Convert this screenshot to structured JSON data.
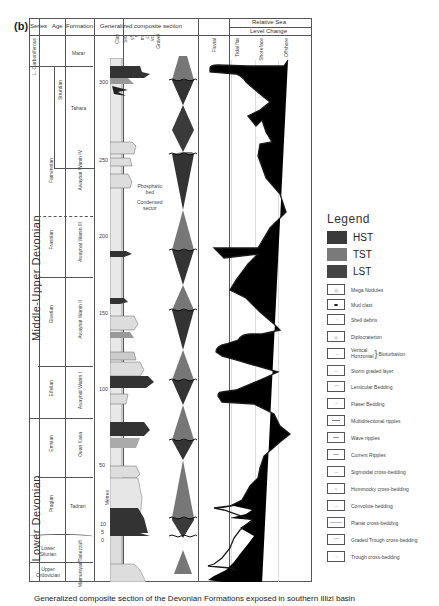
{
  "figure": {
    "panel_label": "(b)",
    "caption": "Generalized composite section of the Devonian Formations exposed in southern Illizi basin"
  },
  "columns": {
    "series": "Series",
    "age": "Age",
    "formation": "Formation",
    "section": "Generalized composite section",
    "sea_level_line1": "Relative Sea",
    "sea_level_line2": "Level Change"
  },
  "grain_size": [
    "Clay",
    "Silt",
    "vf",
    "f",
    "m",
    "c",
    "vc",
    "Gravel"
  ],
  "environments": [
    "Fluvial",
    "Tidal flat",
    "Shoreface",
    "Offshore"
  ],
  "series_units": [
    {
      "label": "L. Carboniferous"
    },
    {
      "label": "Middle-Upper Devonian"
    },
    {
      "label": "Lower Devonian"
    },
    {
      "label": "Lower Silurian"
    },
    {
      "label": "Upper Ordovician"
    }
  ],
  "age_units": [
    "Struntian",
    "Famennian",
    "Frasnian",
    "Givetian",
    "Eifelian",
    "Emsian",
    "Pragian"
  ],
  "formation_units": [
    "Marar",
    "Tahara",
    "Awaynat Wanin IV",
    "Awaynat Wanin III",
    "Awaynat Wanin II",
    "Awaynat Wanin I",
    "Ouan Kasa",
    "Tadrart",
    "Mamuniyat/Tanezzuft"
  ],
  "depth_axis": {
    "unit": "Metres",
    "ticks": [
      "300",
      "250",
      "200",
      "150",
      "100",
      "50",
      "10",
      "5",
      "0"
    ]
  },
  "annotation": {
    "phosphatic_line1": "Phosphatic",
    "phosphatic_line2": "bed",
    "phosphatic_line3": "Condensed",
    "phosphatic_line4": "sector"
  },
  "legend": {
    "title": "Legend",
    "systems_tracts": [
      {
        "label": "HST",
        "color": "#3a3a3a"
      },
      {
        "label": "TST",
        "color": "#7a7a7a"
      },
      {
        "label": "LST",
        "color": "#444444"
      }
    ],
    "symbols": [
      {
        "label": "Mega Nodules",
        "icon": "nodule-icon"
      },
      {
        "label": "Mud clast",
        "icon": "mud-clast-icon"
      },
      {
        "label": "Shell debris",
        "icon": "shell-icon"
      },
      {
        "label": "Diplocraterion",
        "icon": "burrow-icon"
      },
      {
        "label": "Vertical\nHorizontal",
        "suffix": "Bioturbation",
        "icon": "bioturbation-icon"
      },
      {
        "label": "Storm graded layer",
        "icon": "storm-layer-icon"
      },
      {
        "label": "Lenticular Bedding",
        "icon": "lenticular-icon"
      },
      {
        "label": "Flaser Bedding",
        "icon": "flaser-icon"
      },
      {
        "label": "Multidirectional ripples",
        "icon": "ripples-icon"
      },
      {
        "label": "Wave ripples",
        "icon": "wave-ripple-icon"
      },
      {
        "label": "Current Ripples",
        "icon": "current-ripple-icon"
      },
      {
        "label": "Sigmoidal cross-bedding",
        "icon": "sigmoidal-icon"
      },
      {
        "label": "Hummocky cross-bedding",
        "icon": "hummocky-icon"
      },
      {
        "label": "Convolute bedding",
        "icon": "convolute-icon"
      },
      {
        "label": "Planar cross-bedding",
        "icon": "planar-icon"
      },
      {
        "label": "Graded Trough cross-bedding",
        "icon": "graded-trough-icon"
      },
      {
        "label": "Trough cross-bedding",
        "icon": "trough-icon"
      }
    ]
  },
  "colors": {
    "hst": "#3a3a3a",
    "tst": "#7a7a7a",
    "lst": "#444444",
    "line": "#222222",
    "sand": "#e6e6e6"
  }
}
